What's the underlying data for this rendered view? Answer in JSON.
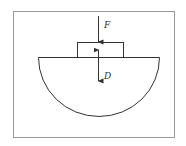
{
  "diagram": {
    "labels": {
      "force": "F",
      "displacement": "D"
    },
    "colors": {
      "stroke": "#333333",
      "frame": "#999999",
      "background": "#ffffff"
    }
  }
}
